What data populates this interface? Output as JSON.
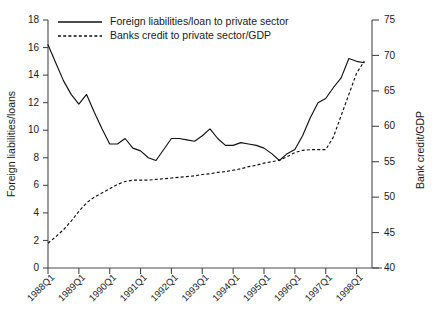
{
  "chart_data": {
    "type": "line",
    "title": "",
    "subtitle": "",
    "xlabel": "",
    "ylabel": "Foreign liabilities/loans",
    "y2label": "Bank credit/GDP",
    "grid": false,
    "legend_position": "top-left-inside",
    "xlim": [
      0,
      42
    ],
    "ylim": [
      0,
      18
    ],
    "y2lim": [
      40,
      75
    ],
    "yticks": [
      0,
      2,
      4,
      6,
      8,
      10,
      12,
      14,
      16,
      18
    ],
    "ytick_labels": [
      "0",
      "2",
      "4",
      "6",
      "8",
      "10",
      "12",
      "14",
      "16",
      "18"
    ],
    "y2ticks": [
      40,
      45,
      50,
      55,
      60,
      65,
      70,
      75
    ],
    "y2tick_labels": [
      "40",
      "45",
      "50",
      "55",
      "60",
      "65",
      "70",
      "75"
    ],
    "xtick_positions": [
      0,
      4,
      8,
      12,
      16,
      20,
      24,
      28,
      32,
      36,
      40
    ],
    "xtick_labels": [
      "1988Q1",
      "1989Q1",
      "1990Q1",
      "1991Q1",
      "1992Q1",
      "1993Q1",
      "1994Q1",
      "1995Q1",
      "1996Q1",
      "1997Q1",
      "1998Q1"
    ],
    "x": [
      0,
      1,
      2,
      3,
      4,
      5,
      6,
      7,
      8,
      9,
      10,
      11,
      12,
      13,
      14,
      15,
      16,
      17,
      18,
      19,
      20,
      21,
      22,
      23,
      24,
      25,
      26,
      27,
      28,
      29,
      30,
      31,
      32,
      33,
      34,
      35,
      36,
      37,
      38,
      39,
      40,
      41
    ],
    "series": [
      {
        "name": "Foreign liabilities/loan to private sector",
        "axis": "left",
        "style": "solid",
        "units": "ratio",
        "values": [
          16.2,
          14.9,
          13.6,
          12.6,
          11.9,
          12.6,
          11.3,
          10.1,
          9.0,
          9.0,
          9.4,
          8.7,
          8.5,
          8.0,
          7.8,
          8.6,
          9.4,
          9.4,
          9.3,
          9.2,
          9.6,
          10.1,
          9.4,
          8.9,
          8.9,
          9.1,
          9.0,
          8.9,
          8.7,
          8.3,
          7.8,
          8.3,
          8.6,
          9.6,
          10.9,
          12.0,
          12.3,
          13.1,
          13.8,
          15.2,
          15.0,
          14.9
        ]
      },
      {
        "name": "Banks credit to private sector/GDP",
        "axis": "right",
        "style": "dashed",
        "units": "percent",
        "values": [
          43.5,
          44.4,
          45.4,
          46.6,
          48.0,
          49.2,
          50.0,
          50.6,
          51.2,
          51.8,
          52.2,
          52.4,
          52.4,
          52.4,
          52.5,
          52.6,
          52.7,
          52.8,
          52.9,
          53.0,
          53.2,
          53.3,
          53.5,
          53.6,
          53.8,
          54.0,
          54.3,
          54.5,
          54.8,
          55.0,
          55.2,
          55.7,
          56.3,
          56.6,
          56.7,
          56.7,
          56.7,
          58.5,
          61.5,
          64.5,
          67.5,
          69.2
        ]
      }
    ],
    "annotations": []
  },
  "legend": {
    "entries": [
      {
        "label": "Foreign liabilities/loan to private sector",
        "style": "solid"
      },
      {
        "label": "Banks credit to private sector/GDP",
        "style": "dashed"
      }
    ]
  },
  "colors": {
    "line": "#111111",
    "axis": "#4a4a4a",
    "text": "#1a1a1a",
    "background": "#ffffff"
  }
}
